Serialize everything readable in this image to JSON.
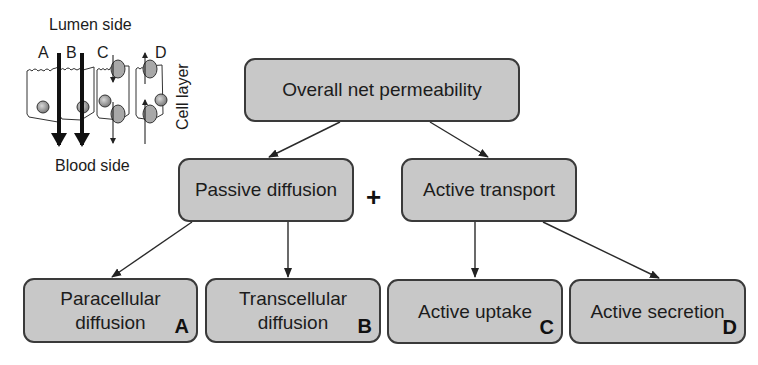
{
  "inset": {
    "top_label": "Lumen side",
    "bottom_label": "Blood side",
    "side_label": "Cell layer",
    "route_letters": [
      "A",
      "B",
      "C",
      "D"
    ]
  },
  "tree": {
    "root": {
      "label": "Overall net permeability"
    },
    "operator": "+",
    "level1": [
      {
        "label": "Passive diffusion"
      },
      {
        "label": "Active transport"
      }
    ],
    "level2": [
      {
        "line1": "Paracellular",
        "line2": "diffusion",
        "letter": "A"
      },
      {
        "line1": "Transcellular",
        "line2": "diffusion",
        "letter": "B"
      },
      {
        "line1": "Active uptake",
        "line2": "",
        "letter": "C"
      },
      {
        "line1": "Active secretion",
        "line2": "",
        "letter": "D"
      }
    ]
  },
  "colors": {
    "box_fill": "#c8c8c8",
    "box_border": "#3a3a3a",
    "text": "#1c1c1c",
    "nucleus": "#9a9a9a",
    "transporter": "#a8a8a8"
  }
}
